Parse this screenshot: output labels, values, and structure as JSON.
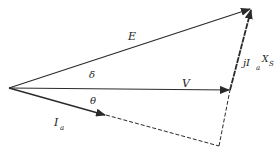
{
  "diagram": {
    "type": "phasor-diagram",
    "colors": {
      "line": "#2a2a2a",
      "background": "#ffffff"
    },
    "points": {
      "origin": [
        9,
        88
      ],
      "V_tip": [
        230,
        90
      ],
      "E_tip": [
        252,
        8
      ],
      "Ia_tip": [
        106,
        115
      ],
      "dash_corner": [
        219,
        146
      ]
    },
    "phasors": [
      {
        "id": "E",
        "label": "E",
        "from": "origin",
        "to": "E_tip",
        "style": "solid"
      },
      {
        "id": "V",
        "label": "V",
        "from": "origin",
        "to": "V_tip",
        "style": "solid"
      },
      {
        "id": "jIaXs",
        "label": "jI",
        "sub1": "a",
        "label2": "X",
        "sub2": "S",
        "from": "V_tip",
        "to": "E_tip",
        "style": "solid"
      },
      {
        "id": "Ia",
        "label": "I",
        "sub1": "a",
        "from": "origin",
        "to": "Ia_tip",
        "style": "solid"
      }
    ],
    "dashed_lines": [
      {
        "from": "Ia_tip",
        "to": "dash_corner"
      },
      {
        "from": "dash_corner",
        "to": "V_tip"
      }
    ],
    "labels": {
      "E": "E",
      "V": "V",
      "delta": "δ",
      "theta": "θ",
      "Ia_main": "I",
      "Ia_sub": "a",
      "jIaXs_j": "jI",
      "jIaXs_sub_a": "a",
      "jIaXs_X": "X",
      "jIaXs_sub_S": "S"
    }
  }
}
